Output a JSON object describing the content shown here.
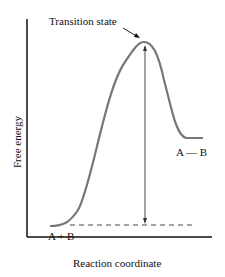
{
  "diagram": {
    "y_axis_label": "Free energy",
    "x_axis_label": "Reaction coordinate",
    "labels": {
      "transition_state": "Transition state",
      "reactants": "A + B",
      "product": "A — B"
    },
    "colors": {
      "curve": "#777777",
      "axes": "#111111",
      "arrow": "#333333"
    }
  }
}
